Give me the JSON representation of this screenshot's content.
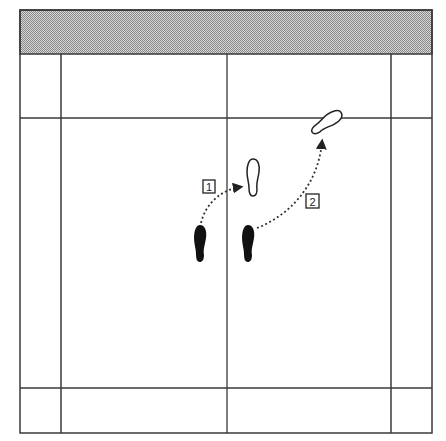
{
  "diagram": {
    "type": "badminton-court-footwork",
    "colors": {
      "line": "#3a3a3a",
      "net_band": "#b4b4b4",
      "footprint_filled": "#111111",
      "footprint_outline": "#222222",
      "arrow": "#333333"
    },
    "court": {
      "outer": {
        "x": 20,
        "y": 10,
        "width": 412,
        "height": 423
      },
      "net_band": {
        "y_top": 10,
        "y_bottom": 54
      },
      "vertical_lines_x": [
        61,
        227,
        391
      ],
      "horizontal_lines_y": [
        118,
        388
      ]
    },
    "steps": [
      {
        "label": "1",
        "box": {
          "x": 203,
          "y": 180,
          "w": 12,
          "h": 13
        }
      },
      {
        "label": "2",
        "box": {
          "x": 306,
          "y": 194,
          "w": 13,
          "h": 14
        }
      }
    ],
    "footprints": {
      "start_left": {
        "cx": 200,
        "cy": 243,
        "filled": true
      },
      "start_right": {
        "cx": 248,
        "cy": 243,
        "filled": true
      },
      "step1_target": {
        "cx": 252,
        "cy": 177,
        "filled": false
      },
      "step2_target": {
        "cx": 327,
        "cy": 122,
        "filled": false,
        "rotation": -55
      }
    }
  }
}
